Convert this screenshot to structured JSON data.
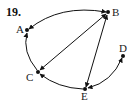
{
  "problem_number": "19.",
  "nodes": {
    "A": {
      "label": "A",
      "x": 27,
      "y": 30
    },
    "B": {
      "label": "B",
      "x": 108,
      "y": 12
    },
    "C": {
      "label": "C",
      "x": 38,
      "y": 72
    },
    "D": {
      "label": "D",
      "x": 123,
      "y": 56
    },
    "E": {
      "label": "E",
      "x": 85,
      "y": 89
    }
  },
  "edges": [
    {
      "from": "A",
      "to": "B",
      "directed": "both",
      "curved": true
    },
    {
      "from": "C",
      "to": "A",
      "directed": "to",
      "curved": true
    },
    {
      "from": "C",
      "to": "B",
      "directed": "both",
      "curved": false
    },
    {
      "from": "E",
      "to": "C",
      "directed": "to",
      "curved": true
    },
    {
      "from": "B",
      "to": "E",
      "directed": "both",
      "curved": false
    },
    {
      "from": "D",
      "to": "E",
      "directed": "both",
      "curved": true
    }
  ],
  "colors": {
    "stroke": "#111111",
    "background": "#ffffff"
  }
}
